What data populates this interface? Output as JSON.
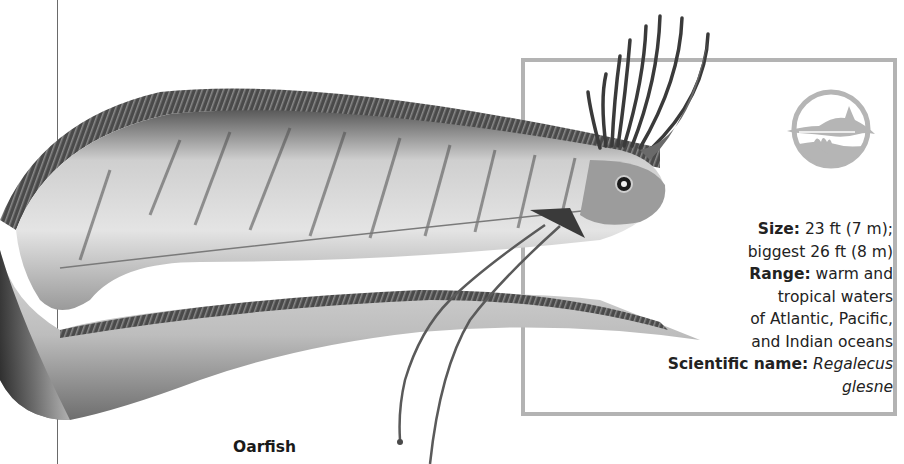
{
  "page": {
    "heading_fragment": "",
    "caption": "Oarfish"
  },
  "info_box": {
    "logo_icon": "dolphin-ocean-icon",
    "border_color": "#b3b3b3",
    "facts": [
      {
        "label": "Size:",
        "value": " 23 ft (7 m);"
      },
      {
        "label": "",
        "value": "biggest 26 ft (8 m)"
      },
      {
        "label": "Range:",
        "value": " warm and"
      },
      {
        "label": "",
        "value": "tropical waters"
      },
      {
        "label": "",
        "value": "of Atlantic, Pacific,"
      },
      {
        "label": "",
        "value": "and Indian oceans"
      },
      {
        "label": "Scientific name:",
        "value": " ",
        "italic": "Regalecus glesne"
      }
    ]
  },
  "illustration": {
    "subject": "oarfish",
    "palette": {
      "dark": "#2e2e2e",
      "mid": "#8a8a8a",
      "light": "#e6e6e6"
    }
  }
}
